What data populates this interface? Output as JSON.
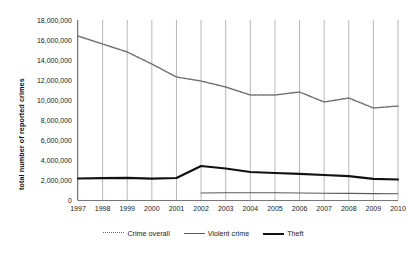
{
  "chart_data": {
    "type": "line",
    "title": "",
    "xlabel": "",
    "ylabel": "total number of reported crimes",
    "categories": [
      "1997",
      "1998",
      "1999",
      "2000",
      "2001",
      "2002",
      "2003",
      "2004",
      "2005",
      "2006",
      "2007",
      "2008",
      "2009",
      "2010"
    ],
    "ylim": [
      0,
      18000000
    ],
    "ytick_labels": [
      "18,000,000",
      "16,000,000",
      "14,000,000",
      "12,000,000",
      "10,000,000",
      "8,000,000",
      "6,000,000",
      "4,000,000",
      "2,000,000",
      "0"
    ],
    "ytick_values": [
      18000000,
      16000000,
      14000000,
      12000000,
      10000000,
      8000000,
      6000000,
      4000000,
      2000000,
      0
    ],
    "grid": "vertical gridlines at each year category",
    "legend_position": "bottom-center",
    "series": [
      {
        "name": "Crime overall",
        "style": "dotted",
        "color": "#6e6e6e",
        "values": [
          16400000,
          15600000,
          14800000,
          13600000,
          12300000,
          11900000,
          11300000,
          10500000,
          10500000,
          10800000,
          9800000,
          10200000,
          9200000,
          9400000
        ]
      },
      {
        "name": "Violent crime",
        "style": "thin-solid",
        "color": "#5a5a5a",
        "values": [
          null,
          null,
          null,
          null,
          null,
          700000,
          720000,
          720000,
          720000,
          700000,
          680000,
          660000,
          640000,
          620000
        ]
      },
      {
        "name": "Theft",
        "style": "thick-solid",
        "color": "#111111",
        "values": [
          2150000,
          2180000,
          2220000,
          2130000,
          2200000,
          3400000,
          3150000,
          2800000,
          2700000,
          2620000,
          2500000,
          2380000,
          2120000,
          2050000
        ]
      }
    ]
  },
  "legend": {
    "items": [
      {
        "label": "Crime overall",
        "marker": "dotted-line-icon"
      },
      {
        "label": "Violent crime",
        "marker": "thin-line-icon"
      },
      {
        "label": "Theft",
        "marker": "thick-line-icon"
      }
    ]
  }
}
